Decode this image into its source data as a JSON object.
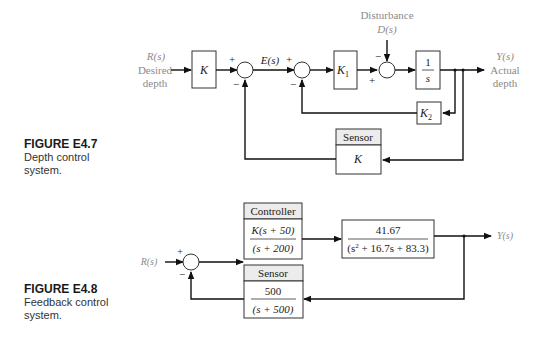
{
  "figures": [
    {
      "id": "E4.7",
      "caption_title": "FIGURE E4.7",
      "caption_line1": "Depth control",
      "caption_line2": "system.",
      "input_label": "R(s)",
      "input_desc1": "Desired",
      "input_desc2": "depth",
      "output_label": "Y(s)",
      "output_desc1": "Actual",
      "output_desc2": "depth",
      "disturbance_label": "Disturbance",
      "disturbance_signal": "D(s)",
      "error_signal": "E(s)",
      "blocks": {
        "prefilter": "K",
        "k1": "K",
        "k1_sub": "1",
        "integrator_num": "1",
        "integrator_den": "s",
        "k2": "K",
        "k2_sub": "2",
        "sensor_header": "Sensor",
        "sensor_value": "K"
      },
      "signs": {
        "sum1_plus": "+",
        "sum1_minus": "−",
        "sum2_plus": "+",
        "sum2_minus": "−",
        "sum3_minus": "−",
        "sum3_plus": "+"
      }
    },
    {
      "id": "E4.8",
      "caption_title": "FIGURE E4.8",
      "caption_line1": "Feedback control",
      "caption_line2": "system.",
      "input_label": "R(s)",
      "output_label": "Y(s)",
      "blocks": {
        "controller_header": "Controller",
        "controller_num": "K(s + 50)",
        "controller_den": "(s + 200)",
        "plant_num": "41.67",
        "plant_den_a": "(s",
        "plant_den_sup": "2",
        "plant_den_b": " + 16.7s + 83.3)",
        "sensor_header": "Sensor",
        "sensor_num": "500",
        "sensor_den": "(s + 500)"
      },
      "signs": {
        "sum_plus": "+",
        "sum_minus": "−"
      }
    }
  ]
}
